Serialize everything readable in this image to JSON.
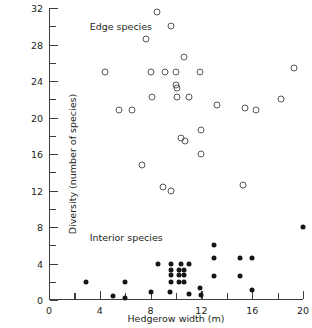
{
  "chart_data": {
    "type": "scatter",
    "title": "",
    "xlabel": "Hedgerow width (m)",
    "ylabel": "Diversity (number of species)",
    "xlim": [
      0,
      20
    ],
    "ylim": [
      0,
      32
    ],
    "grid": false,
    "legend_position": "in-plot annotations",
    "x_ticks_major": [
      0,
      4,
      8,
      12,
      16,
      20
    ],
    "x_ticks_minor": [
      2,
      6,
      10,
      14,
      18
    ],
    "y_ticks_major": [
      0,
      4,
      8,
      12,
      16,
      20,
      24,
      28,
      32
    ],
    "y_ticks_minor": [
      2,
      6,
      10,
      14,
      18,
      22,
      26,
      30
    ],
    "x_tick_labels": [
      "0",
      "4",
      "8",
      "12",
      "16",
      "20"
    ],
    "y_tick_labels": [
      "0",
      "4",
      "8",
      "12",
      "16",
      "20",
      "24",
      "28",
      "32"
    ],
    "annotations": [
      {
        "text": "Edge species",
        "x": 3.2,
        "y": 30.6
      },
      {
        "text": "Interior species",
        "x": 3.2,
        "y": 7.4
      }
    ],
    "series": [
      {
        "name": "Edge species",
        "marker": "open-circle",
        "color": "#53565a",
        "points": [
          [
            8.5,
            31.6
          ],
          [
            9.6,
            30.0
          ],
          [
            7.6,
            28.6
          ],
          [
            10.6,
            26.6
          ],
          [
            4.4,
            25.0
          ],
          [
            8.0,
            25.0
          ],
          [
            9.1,
            25.0
          ],
          [
            10.0,
            25.0
          ],
          [
            11.9,
            25.0
          ],
          [
            19.3,
            25.4
          ],
          [
            10.0,
            23.6
          ],
          [
            10.1,
            23.2
          ],
          [
            8.1,
            22.2
          ],
          [
            10.1,
            22.2
          ],
          [
            11.0,
            22.2
          ],
          [
            18.3,
            22.0
          ],
          [
            5.5,
            20.8
          ],
          [
            6.5,
            20.8
          ],
          [
            13.2,
            21.4
          ],
          [
            15.4,
            21.0
          ],
          [
            16.3,
            20.8
          ],
          [
            12.0,
            18.6
          ],
          [
            10.4,
            17.8
          ],
          [
            10.7,
            17.4
          ],
          [
            7.3,
            14.8
          ],
          [
            12.0,
            16.0
          ],
          [
            9.0,
            12.4
          ],
          [
            9.6,
            12.0
          ],
          [
            15.3,
            12.6
          ]
        ]
      },
      {
        "name": "Interior species",
        "marker": "filled-circle",
        "color": "#16161a",
        "points": [
          [
            20.0,
            8.0
          ],
          [
            13.0,
            6.0
          ],
          [
            13.0,
            4.6
          ],
          [
            15.0,
            4.6
          ],
          [
            16.0,
            4.6
          ],
          [
            11.0,
            4.0
          ],
          [
            8.6,
            4.0
          ],
          [
            9.6,
            4.0
          ],
          [
            10.4,
            4.0
          ],
          [
            9.6,
            3.3
          ],
          [
            10.2,
            3.3
          ],
          [
            10.6,
            3.3
          ],
          [
            9.6,
            2.7
          ],
          [
            10.2,
            2.7
          ],
          [
            10.6,
            2.7
          ],
          [
            13.0,
            2.6
          ],
          [
            15.0,
            2.6
          ],
          [
            2.9,
            2.0
          ],
          [
            6.0,
            2.0
          ],
          [
            9.6,
            2.0
          ],
          [
            10.2,
            2.0
          ],
          [
            10.6,
            2.0
          ],
          [
            11.9,
            1.3
          ],
          [
            16.0,
            1.1
          ],
          [
            8.0,
            0.9
          ],
          [
            9.5,
            0.9
          ],
          [
            11.0,
            0.7
          ],
          [
            12.0,
            0.6
          ],
          [
            5.0,
            0.4
          ],
          [
            6.0,
            0.2
          ]
        ]
      }
    ]
  }
}
